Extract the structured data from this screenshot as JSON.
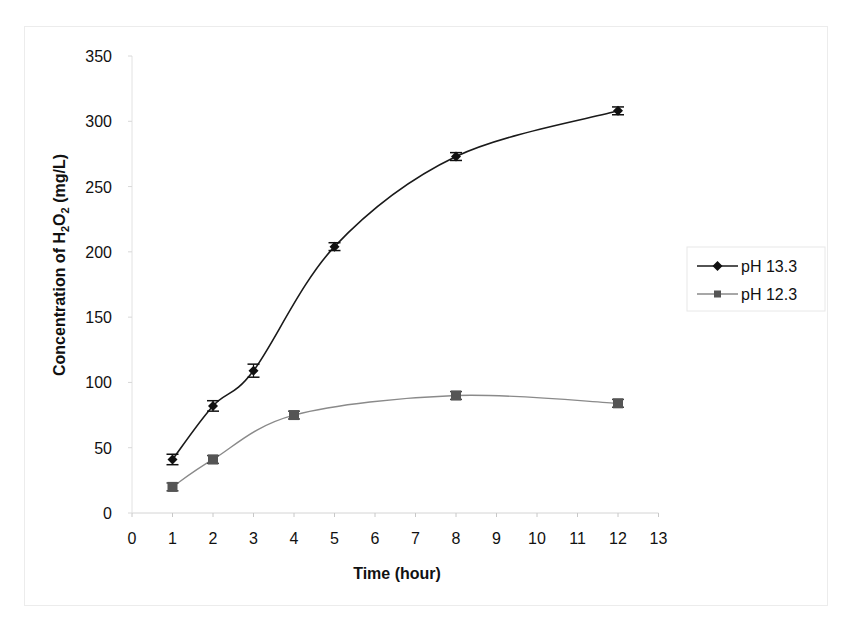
{
  "chart_data": {
    "type": "line",
    "title": "",
    "xlabel": "Time (hour)",
    "ylabel": "Concentration of H2O2 (mg/L)",
    "ylabel_parts": [
      "Concentration of    H",
      "2",
      "O",
      "2",
      " (mg/L)"
    ],
    "xlim": [
      0,
      13
    ],
    "ylim": [
      0,
      350
    ],
    "xticks": [
      0,
      1,
      2,
      3,
      4,
      5,
      6,
      7,
      8,
      9,
      10,
      11,
      12,
      13
    ],
    "yticks": [
      0,
      50,
      100,
      150,
      200,
      250,
      300,
      350
    ],
    "grid": false,
    "legend_position": "right",
    "series": [
      {
        "name": "pH 13.3",
        "color": "#1a1a1a",
        "marker": "diamond",
        "x": [
          1,
          2,
          3,
          5,
          8,
          12
        ],
        "values": [
          41,
          82,
          109,
          204,
          273,
          308
        ],
        "error": [
          4,
          4,
          5,
          3,
          3,
          3
        ]
      },
      {
        "name": "pH 12.3",
        "color": "#8a8a8a",
        "marker": "square",
        "marker_color": "#555555",
        "x": [
          1,
          2,
          4,
          8,
          12
        ],
        "values": [
          20,
          41,
          75,
          90,
          84
        ],
        "error": [
          3,
          3,
          3,
          3,
          3
        ]
      }
    ]
  },
  "legend": {
    "items": [
      {
        "label": "pH 13.3"
      },
      {
        "label": "pH 12.3"
      }
    ]
  },
  "axes": {
    "x_title": "Time (hour)"
  }
}
